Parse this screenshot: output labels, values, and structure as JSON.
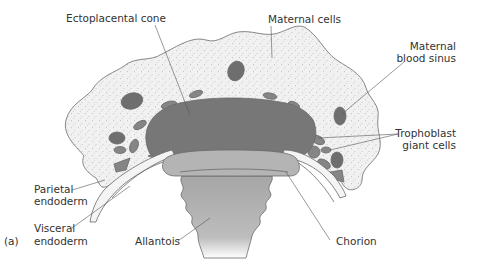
{
  "figure": {
    "panel_label": "(a)",
    "labels": {
      "ectoplacental_cone": "Ectoplacental cone",
      "maternal_cells": "Maternal cells",
      "maternal_blood_sinus_line1": "Maternal",
      "maternal_blood_sinus_line2": "blood sinus",
      "trophoblast_giant_cells_line1": "Trophoblast",
      "trophoblast_giant_cells_line2": "giant cells",
      "parietal_endoderm_line1": "Parietal",
      "parietal_endoderm_line2": "endoderm",
      "visceral_endoderm_line1": "Visceral",
      "visceral_endoderm_line2": "endoderm",
      "allantois": "Allantois",
      "chorion": "Chorion"
    },
    "colors": {
      "maternal_tissue": "#efefef",
      "stipple": "#8a8a8a",
      "ectoplacental_cone": "#777777",
      "blood_sinus": "#6e6e6e",
      "giant_cells": "#858585",
      "chorion": "#b4b4b4",
      "allantois": "#a9a9a9",
      "endoderm": "#f4f4f4",
      "text": "#333333"
    }
  }
}
